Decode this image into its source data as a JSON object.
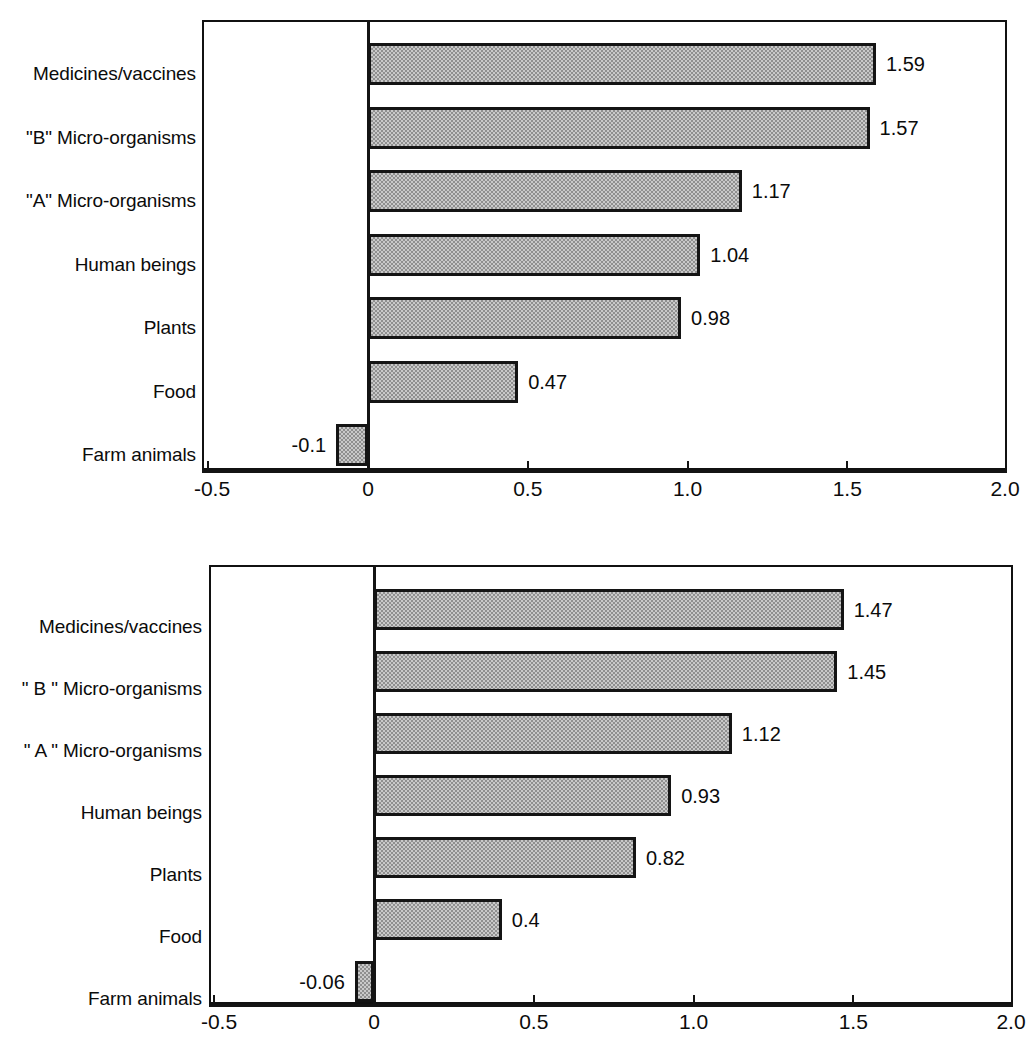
{
  "chart_data": [
    {
      "type": "bar",
      "orientation": "horizontal",
      "title": "",
      "subtitle": "",
      "xlabel": "",
      "ylabel": "",
      "categories": [
        "Medicines/vaccines",
        "\"B\" Micro-organisms",
        "\"A\" Micro-organisms",
        "Human beings",
        "Plants",
        "Food",
        "Farm animals"
      ],
      "values": [
        1.59,
        1.57,
        1.17,
        1.04,
        0.98,
        0.47,
        -0.1
      ],
      "value_labels": [
        "1.59",
        "1.57",
        "1.17",
        "1.04",
        "0.98",
        "0.47",
        "-0.1"
      ],
      "xlim": [
        -0.52,
        2.0
      ],
      "xticks": [
        -0.5,
        0,
        0.5,
        1.0,
        1.5,
        2.0
      ],
      "xticklabels": [
        "-0.5",
        "0",
        "0.5",
        "1.0",
        "1.5",
        "2.0"
      ],
      "grid": false,
      "legend": null,
      "bar_fill": "#c9c9c9",
      "bar_edge": "#141414"
    },
    {
      "type": "bar",
      "orientation": "horizontal",
      "title": "",
      "subtitle": "",
      "xlabel": "",
      "ylabel": "",
      "categories": [
        "Medicines/vaccines",
        "\" B \" Micro-organisms",
        "\" A \" Micro-organisms",
        "Human beings",
        "Plants",
        "Food",
        "Farm animals"
      ],
      "values": [
        1.47,
        1.45,
        1.12,
        0.93,
        0.82,
        0.4,
        -0.06
      ],
      "value_labels": [
        "1.47",
        "1.45",
        "1.12",
        "0.93",
        "0.82",
        "0.4",
        "-0.06"
      ],
      "xlim": [
        -0.52,
        2.0
      ],
      "xticks": [
        -0.5,
        0,
        0.5,
        1.0,
        1.5,
        2.0
      ],
      "xticklabels": [
        "-0.5",
        "0",
        "0.5",
        "1.0",
        "1.5",
        "2.0"
      ],
      "grid": false,
      "legend": null,
      "bar_fill": "#c9c9c9",
      "bar_edge": "#141414"
    }
  ],
  "colors": {
    "bar_fill": "#c9c9c9",
    "bar_edge": "#141414",
    "axis": "#111111",
    "text": "#0b0b0b",
    "background": "#ffffff"
  }
}
